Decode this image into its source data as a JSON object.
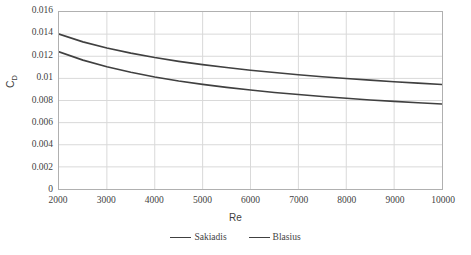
{
  "chart_data": {
    "type": "line",
    "title": "",
    "subtitle": "",
    "xlabel": "Re",
    "ylabel": "CD",
    "ylabel_base": "C",
    "ylabel_sub": "D",
    "xlim": [
      2000,
      10000
    ],
    "ylim": [
      0,
      0.016
    ],
    "grid": true,
    "legend_position": "bottom-center",
    "x_ticks": [
      2000,
      3000,
      4000,
      5000,
      6000,
      7000,
      8000,
      9000,
      10000
    ],
    "x_tick_labels": [
      "2000",
      "3000",
      "4000",
      "5000",
      "6000",
      "7000",
      "8000",
      "9000",
      "10000"
    ],
    "y_ticks": [
      0,
      0.002,
      0.004,
      0.006,
      0.008,
      0.01,
      0.012,
      0.014,
      0.016
    ],
    "y_tick_labels": [
      "0",
      "0.002",
      "0.004",
      "0.006",
      "0.008",
      "0.01",
      "0.012",
      "0.014",
      "0.016"
    ],
    "x": [
      2000,
      2500,
      3000,
      3500,
      4000,
      4500,
      5000,
      5500,
      6000,
      6500,
      7000,
      7500,
      8000,
      8500,
      9000,
      9500,
      10000
    ],
    "series": [
      {
        "name": "Sakiadis",
        "color": "#404040",
        "values": [
          0.014,
          0.0133,
          0.01275,
          0.01228,
          0.01188,
          0.01154,
          0.01124,
          0.01098,
          0.01074,
          0.01053,
          0.01033,
          0.01015,
          0.00999,
          0.00984,
          0.0097,
          0.00957,
          0.00945
        ]
      },
      {
        "name": "Blasius",
        "color": "#404040",
        "values": [
          0.0124,
          0.01165,
          0.01105,
          0.01055,
          0.01013,
          0.00977,
          0.00946,
          0.00919,
          0.00895,
          0.00873,
          0.00854,
          0.00836,
          0.0082,
          0.00805,
          0.00792,
          0.00779,
          0.00768
        ]
      }
    ]
  },
  "style": {
    "line_color": "#404040",
    "grid_color": "#d9d9d9",
    "frame_color": "#b0b0b0",
    "text_color": "#3f3f3f",
    "background": "#ffffff"
  }
}
